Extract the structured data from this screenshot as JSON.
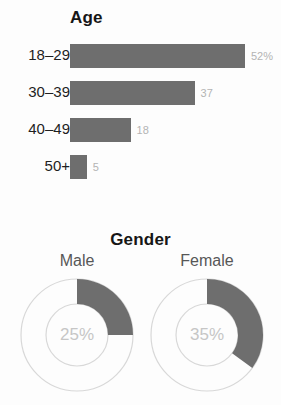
{
  "chart_data": [
    {
      "type": "bar",
      "title": "Age",
      "orientation": "horizontal",
      "xlabel": "",
      "ylabel": "",
      "grid": false,
      "legend": "none",
      "categories": [
        "18–29",
        "30–39",
        "40–49",
        "50+"
      ],
      "values": [
        52,
        37,
        18,
        5
      ],
      "value_labels": [
        "52%",
        "37",
        "18",
        "5"
      ],
      "xlim": [
        0,
        52
      ],
      "bar_color": "#6e6e6e",
      "value_label_color": "#b4b4b4"
    },
    {
      "type": "pie",
      "subtype": "donut",
      "title": "Gender",
      "legend": "none",
      "slices": [
        {
          "label": "Male",
          "value": 25,
          "center_label": "25%"
        },
        {
          "label": "Female",
          "value": 35,
          "center_label": "35%"
        }
      ],
      "arc_color": "#6e6e6e",
      "ring_color": "#d8d8d8",
      "center_label_color": "#c6c6c6"
    }
  ],
  "age": {
    "title": "Age",
    "rows": [
      {
        "label": "18–29",
        "value_label": "52%"
      },
      {
        "label": "30–39",
        "value_label": "37"
      },
      {
        "label": "40–49",
        "value_label": "18"
      },
      {
        "label": "50+",
        "value_label": "5"
      }
    ]
  },
  "gender": {
    "title": "Gender",
    "male": {
      "caption": "Male",
      "center_label": "25%"
    },
    "female": {
      "caption": "Female",
      "center_label": "35%"
    }
  }
}
